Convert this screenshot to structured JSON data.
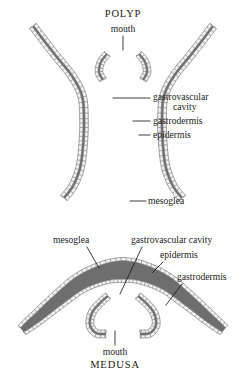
{
  "figure": {
    "background_color": "#ffffff",
    "ink_color": "#1a1a1a",
    "mesoglea_fill": "#6e6e6e",
    "cell_fill": "#f2f2f2",
    "cell_stroke": "#6b6b6b",
    "lumen_fill": "#ffffff"
  },
  "polyp": {
    "title": "POLYP",
    "title_pos": {
      "x": 123,
      "y": 17
    },
    "labels": [
      {
        "id": "mouth",
        "text": "mouth",
        "text_pos": {
          "x": 123,
          "y": 32
        },
        "anchor": "middle",
        "leader": "M 123 36 L 123 50"
      },
      {
        "id": "gastrovascular-cavity",
        "text": "gastrovascular",
        "text2": "cavity",
        "text_pos": {
          "x": 153,
          "y": 100
        },
        "text2_pos": {
          "x": 173,
          "y": 110
        },
        "anchor": "start",
        "leader": "M 150 98 L 113 98"
      },
      {
        "id": "gastrodermis",
        "text": "gastrodermis",
        "text_pos": {
          "x": 153,
          "y": 124
        },
        "anchor": "start",
        "leader": "M 150 121 L 133 121"
      },
      {
        "id": "epidermis",
        "text": "epidermis",
        "text_pos": {
          "x": 153,
          "y": 138
        },
        "anchor": "start",
        "leader": "M 150 135 L 139 135"
      },
      {
        "id": "mesoglea",
        "text": "mesoglea",
        "text_pos": {
          "x": 148,
          "y": 204
        },
        "anchor": "start",
        "leader": "M 146 201 L 130 201"
      }
    ]
  },
  "medusa": {
    "title": "MEDUSA",
    "title_pos": {
      "x": 115,
      "y": 368
    },
    "labels": [
      {
        "id": "mesoglea",
        "text": "mesoglea",
        "text_pos": {
          "x": 53,
          "y": 243
        },
        "anchor": "start",
        "leader": "M 87 247 L 99 268"
      },
      {
        "id": "gastrovascular-cavity",
        "text": "gastrovascular cavity",
        "text_pos": {
          "x": 131,
          "y": 243
        },
        "anchor": "start",
        "leader": "M 142 247 L 120 294"
      },
      {
        "id": "epidermis",
        "text": "epidermis",
        "text_pos": {
          "x": 160,
          "y": 258
        },
        "anchor": "start",
        "leader": "M 163 262 L 152 273"
      },
      {
        "id": "gastrodermis",
        "text": "gastrodermis",
        "text_pos": {
          "x": 177,
          "y": 280
        },
        "anchor": "start",
        "leader": "M 182 284 L 166 305"
      },
      {
        "id": "mouth",
        "text": "mouth",
        "text_pos": {
          "x": 115,
          "y": 355
        },
        "anchor": "middle",
        "leader": "M 115 331 L 115 345"
      }
    ]
  }
}
